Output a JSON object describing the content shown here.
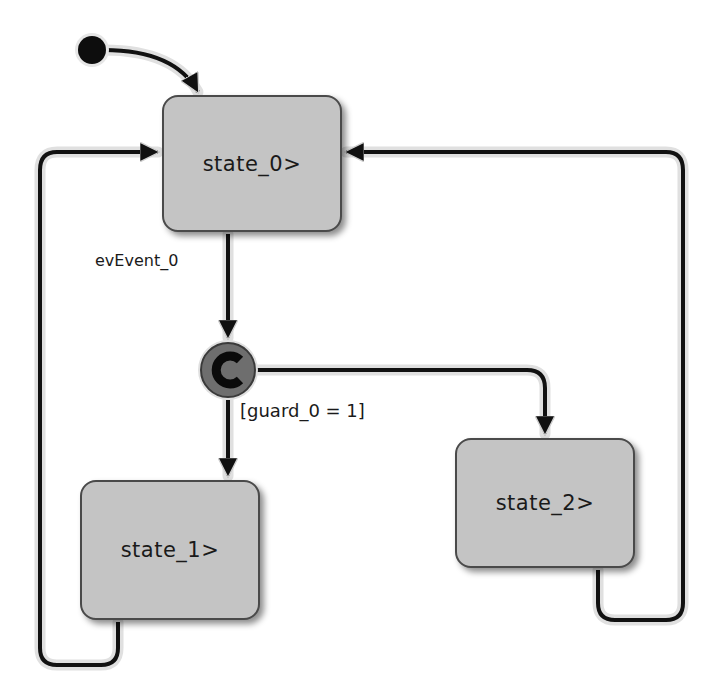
{
  "diagram": {
    "type": "statechart",
    "states": [
      {
        "id": "state_0",
        "label": "state_0>"
      },
      {
        "id": "state_1",
        "label": "state_1>"
      },
      {
        "id": "state_2",
        "label": "state_2>"
      }
    ],
    "connector": {
      "id": "condition_connector",
      "glyph": "C",
      "color": "#6e6e6e"
    },
    "initial": {
      "target": "state_0"
    },
    "transitions": [
      {
        "from": "initial",
        "to": "state_0",
        "label": ""
      },
      {
        "from": "state_0",
        "to": "condition_connector",
        "label": "evEvent_0"
      },
      {
        "from": "condition_connector",
        "to": "state_1",
        "label": "[guard_0 = 1]"
      },
      {
        "from": "condition_connector",
        "to": "state_2",
        "label": ""
      },
      {
        "from": "state_1",
        "to": "state_0",
        "label": ""
      },
      {
        "from": "state_2",
        "to": "state_0",
        "label": ""
      }
    ],
    "colors": {
      "state_fill": "#c4c4c4",
      "state_border": "#4a4a4a",
      "edge": "#111111",
      "edge_halo": "#d8d8d8"
    }
  }
}
